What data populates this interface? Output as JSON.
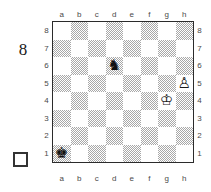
{
  "margin": {
    "move_number": "8",
    "side_to_move_marker": "white-square-outline"
  },
  "board": {
    "files": [
      "a",
      "b",
      "c",
      "d",
      "e",
      "f",
      "g",
      "h"
    ],
    "ranks": [
      "8",
      "7",
      "6",
      "5",
      "4",
      "3",
      "2",
      "1"
    ],
    "light_square_color": "#ffffff",
    "dark_square_color": "#a8a8a8",
    "border_color": "#2b2b2b",
    "orientation": "white-bottom",
    "pieces": [
      {
        "square": "d6",
        "piece": "black-knight",
        "color": "black",
        "type": "knight"
      },
      {
        "square": "h5",
        "piece": "white-pawn",
        "color": "white",
        "type": "pawn"
      },
      {
        "square": "g4",
        "piece": "white-king",
        "color": "white",
        "type": "king"
      },
      {
        "square": "a1",
        "piece": "black-king",
        "color": "black",
        "type": "king"
      }
    ]
  }
}
